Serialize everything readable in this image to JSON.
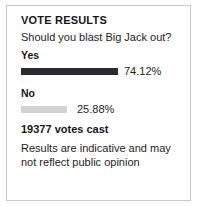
{
  "poll": {
    "title": "VOTE RESULTS",
    "question": "Should you blast Big Jack out?",
    "votes_cast": "19377 votes cast",
    "disclaimer": "Results are indicative and may not reflect public opinion",
    "colors": {
      "yes_bar": "#2b2b2f",
      "no_bar": "#d2d2d4",
      "card_border": "#c9c9c9",
      "text": "#1d1d20"
    },
    "options": [
      {
        "label": "Yes",
        "percent_text": "74.12%",
        "percent_value": 74.12,
        "bar_width_px": 97,
        "pct_offset_px": 6
      },
      {
        "label": "No",
        "percent_text": "25.88%",
        "percent_value": 25.88,
        "bar_width_px": 46,
        "pct_offset_px": 10
      }
    ]
  },
  "chart_data": {
    "type": "bar",
    "title": "VOTE RESULTS",
    "subtitle": "Should you blast Big Jack out?",
    "categories": [
      "Yes",
      "No"
    ],
    "values": [
      74.12,
      25.88
    ],
    "value_labels": [
      "74.12%",
      "25.88%"
    ],
    "unit": "%",
    "total_votes": 19377,
    "xlabel": "",
    "ylabel": "",
    "ylim": [
      0,
      100
    ],
    "orientation": "horizontal",
    "grid": false,
    "legend": false,
    "series_colors": [
      "#2b2b2f",
      "#d2d2d4"
    ],
    "annotation": "Results are indicative and may not reflect public opinion"
  }
}
